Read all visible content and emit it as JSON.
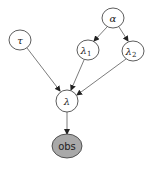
{
  "diagram": {
    "type": "directed-graphical-model",
    "colors": {
      "node_fill": "#ffffff",
      "observed_fill": "#a9a9a9",
      "stroke": "#333333",
      "edge": "#444444"
    },
    "nodes": [
      {
        "id": "tau",
        "label": "τ",
        "subscript": "",
        "observed": false
      },
      {
        "id": "alpha",
        "label": "α",
        "subscript": "",
        "observed": false
      },
      {
        "id": "lambda1",
        "label": "λ",
        "subscript": "1",
        "observed": false
      },
      {
        "id": "lambda2",
        "label": "λ",
        "subscript": "2",
        "observed": false
      },
      {
        "id": "lambda",
        "label": "λ",
        "subscript": "",
        "observed": false
      },
      {
        "id": "obs",
        "label": "obs",
        "subscript": "",
        "observed": true
      }
    ],
    "edges": [
      {
        "from": "alpha",
        "to": "lambda1"
      },
      {
        "from": "alpha",
        "to": "lambda2"
      },
      {
        "from": "tau",
        "to": "lambda"
      },
      {
        "from": "lambda1",
        "to": "lambda"
      },
      {
        "from": "lambda2",
        "to": "lambda"
      },
      {
        "from": "lambda",
        "to": "obs"
      }
    ]
  }
}
